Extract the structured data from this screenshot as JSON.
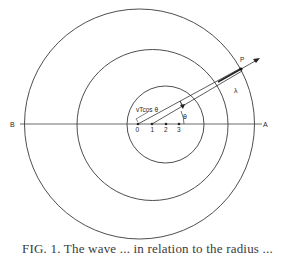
{
  "figure": {
    "labels": {
      "left_end": "B",
      "right_end": "A",
      "point": "P",
      "wavelength": "λ",
      "angle": "θ",
      "projection": "vTcos θ"
    },
    "ticks": [
      "0",
      "1",
      "2",
      "3"
    ],
    "caption": "FIG. 1. The wave ... in relation to the radius ..."
  },
  "geometry": {
    "axis_y": 124,
    "circles": [
      {
        "name": "outer-wavefront",
        "cx": 139.5,
        "cy": 124,
        "r": 115
      },
      {
        "name": "middle-wavefront",
        "cx": 152.5,
        "cy": 125,
        "r": 75.5
      },
      {
        "name": "inner-wavefront",
        "cx": 165.5,
        "cy": 124.5,
        "r": 38.5
      }
    ],
    "tick_x": [
      138,
      152,
      166,
      179
    ]
  },
  "colors": {
    "line": "#2e2e2e",
    "background": "#ffffff"
  }
}
